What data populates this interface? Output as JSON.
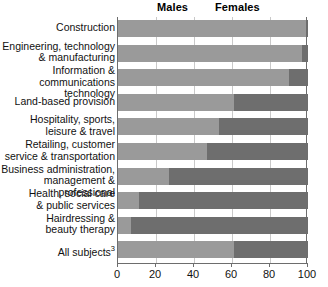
{
  "legend": {
    "males_label": "Males",
    "females_label": "Females"
  },
  "axis": {
    "ticks": [
      "0",
      "20",
      "40",
      "60",
      "80",
      "100"
    ]
  },
  "categories": [
    "Construction",
    "Engineering, technology\n& manufacturing",
    "Information & communications\ntechnology",
    "Land-based provision",
    "Hospitality, sports,\nleisure & travel",
    "Retailing, customer\nservice & transportation",
    "Business administration,\nmanagement & professional",
    "Health, social care\n& public services",
    "Hairdressing &\nbeauty therapy",
    "All subjects"
  ],
  "all_subjects_superscript": "3",
  "chart_data": {
    "type": "bar",
    "orientation": "horizontal",
    "stacked": true,
    "stack_mode": "percent",
    "title": "",
    "subtitle": "",
    "xlabel": "",
    "ylabel": "",
    "xlim": [
      0,
      100
    ],
    "xticks": [
      0,
      20,
      40,
      60,
      80,
      100
    ],
    "grid": true,
    "grid_axis": "x",
    "legend_position": "top",
    "categories": [
      "Construction",
      "Engineering, technology & manufacturing",
      "Information & communications technology",
      "Land-based provision",
      "Hospitality, sports, leisure & travel",
      "Retailing, customer service & transportation",
      "Business administration, management & professional",
      "Health, social care & public services",
      "Hairdressing & beauty therapy",
      "All subjects"
    ],
    "series": [
      {
        "name": "Males",
        "color": "#9a9a9a",
        "values": [
          99,
          97,
          90,
          61,
          53,
          47,
          27,
          11,
          7,
          61
        ]
      },
      {
        "name": "Females",
        "color": "#6e6e6e",
        "values": [
          1,
          3,
          10,
          39,
          47,
          53,
          73,
          89,
          93,
          39
        ]
      }
    ]
  },
  "colors": {
    "males": "#9a9a9a",
    "females": "#6e6e6e",
    "grid": "#c9c9c9",
    "axis": "#6d6d6d",
    "background": "#ffffff"
  }
}
